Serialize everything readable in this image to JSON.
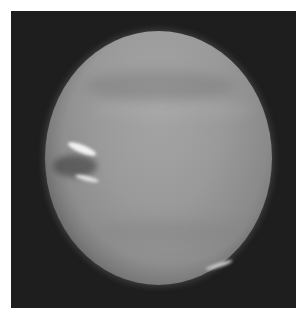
{
  "image": {
    "subject": "Neptune",
    "description": "Grayscale photograph of the planet Neptune showing atmospheric banding, a dark spot with bright white companion clouds on the left limb, and a faint bright streak near the lower right limb",
    "colors": {
      "page_background": "#ffffff",
      "frame_background": "#1e1e1e",
      "planet_tone": "#9a9a9a",
      "bright_clouds": "#f2f2f2"
    }
  }
}
